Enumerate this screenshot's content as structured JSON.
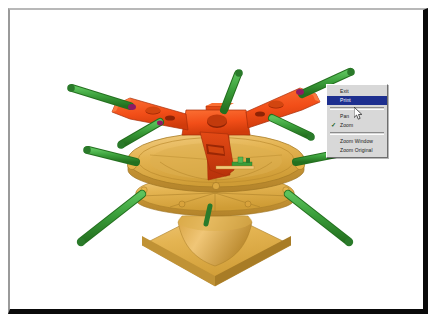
{
  "window": {
    "title": "3D Model Viewer",
    "frame_style": "inset",
    "canvas_background": "#ffffff"
  },
  "colors": {
    "spider_orange": "#f24e18",
    "spider_orange_light": "#fa6a30",
    "spider_orange_dark": "#c8380c",
    "disc_gold": "#e8b44a",
    "disc_gold_light": "#f2c97a",
    "disc_gold_dark": "#c08f2e",
    "leg_green": "#3a9e3a",
    "leg_green_dark": "#2a7a2a",
    "leg_green_light": "#54b854",
    "tip_magenta": "#8e1a62",
    "menu_highlight": "#1d2f8f",
    "menu_face": "#d8d8d8",
    "frame_dark": "#0a0a0a",
    "frame_light": "#b8b8b8"
  },
  "model": {
    "name": "rotor-hub-assembly",
    "description": "Three-arm orange spider hub mounted on a gold circular disc platform with green cylindrical legs and magenta end caps",
    "parts": [
      {
        "name": "spider-hub",
        "color": "#f24e18"
      },
      {
        "name": "disc-platform",
        "color": "#e8b44a"
      },
      {
        "name": "pedestal-base",
        "color": "#e8b44a"
      },
      {
        "name": "leg-cylinder",
        "color": "#3a9e3a"
      },
      {
        "name": "leg-end-cap",
        "color": "#8e1a62"
      }
    ]
  },
  "context_menu": {
    "visible": true,
    "items": [
      {
        "label": "Exit",
        "selected": false,
        "checked": false,
        "separator_after": false
      },
      {
        "label": "Print",
        "selected": true,
        "checked": false,
        "separator_after": true
      },
      {
        "label": "Pan",
        "selected": false,
        "checked": false,
        "separator_after": false
      },
      {
        "label": "Zoom",
        "selected": false,
        "checked": true,
        "separator_after": true
      },
      {
        "label": "Zoom Window",
        "selected": false,
        "checked": false,
        "separator_after": false
      },
      {
        "label": "Zoom Original",
        "selected": false,
        "checked": false,
        "separator_after": false
      }
    ],
    "check_glyph": "✓"
  },
  "cursor": {
    "type": "arrow-pointer",
    "x": 344,
    "y": 97
  }
}
